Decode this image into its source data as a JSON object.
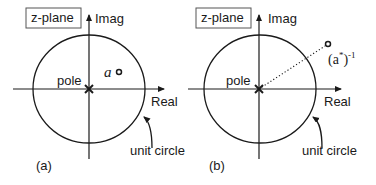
{
  "panels": [
    {
      "id": "a",
      "caption": "(a)",
      "plane_label": "z-plane",
      "imag_axis_label": "Imag",
      "real_axis_label": "Real",
      "pole_label": "pole",
      "circle_label": "unit circle",
      "zero_label": "a",
      "pole_position": "origin",
      "zero_position": "inside unit circle, first quadrant"
    },
    {
      "id": "b",
      "caption": "(b)",
      "plane_label": "z-plane",
      "imag_axis_label": "Imag",
      "real_axis_label": "Real",
      "pole_label": "pole",
      "circle_label": "unit circle",
      "zero_label_base": "(a",
      "zero_label_star": "*",
      "zero_label_close": ")",
      "zero_label_exp": "-1",
      "pole_position": "origin",
      "zero_position": "outside unit circle, first quadrant, connected to origin by dotted line"
    }
  ],
  "colors": {
    "stroke": "#1a1a1a",
    "box_border": "#555555",
    "background": "#ffffff"
  }
}
